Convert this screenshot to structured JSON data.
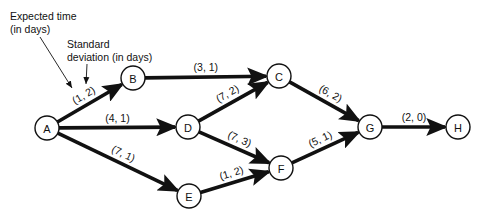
{
  "annotations": {
    "expected_time": {
      "line1": "Expected time",
      "line2": "(in days)"
    },
    "std_dev": {
      "line1": "Standard",
      "line2": "deviation (in days)"
    }
  },
  "nodes": [
    {
      "id": "A",
      "label": "A",
      "x": 47,
      "y": 128
    },
    {
      "id": "B",
      "label": "B",
      "x": 133,
      "y": 78
    },
    {
      "id": "C",
      "label": "C",
      "x": 279,
      "y": 76
    },
    {
      "id": "D",
      "label": "D",
      "x": 188,
      "y": 127
    },
    {
      "id": "E",
      "label": "E",
      "x": 189,
      "y": 196
    },
    {
      "id": "F",
      "label": "F",
      "x": 281,
      "y": 168
    },
    {
      "id": "G",
      "label": "G",
      "x": 370,
      "y": 127
    },
    {
      "id": "H",
      "label": "H",
      "x": 458,
      "y": 127
    }
  ],
  "edges": [
    {
      "from": "A",
      "to": "B",
      "label": "(1, 2)",
      "expected_time": 1,
      "std_dev": 2
    },
    {
      "from": "A",
      "to": "D",
      "label": "(4, 1)",
      "expected_time": 4,
      "std_dev": 1
    },
    {
      "from": "A",
      "to": "E",
      "label": "(7, 1)",
      "expected_time": 7,
      "std_dev": 1
    },
    {
      "from": "B",
      "to": "C",
      "label": "(3, 1)",
      "expected_time": 3,
      "std_dev": 1
    },
    {
      "from": "D",
      "to": "C",
      "label": "(7, 2)",
      "expected_time": 7,
      "std_dev": 2
    },
    {
      "from": "D",
      "to": "F",
      "label": "(7, 3)",
      "expected_time": 7,
      "std_dev": 3
    },
    {
      "from": "E",
      "to": "F",
      "label": "(1, 2)",
      "expected_time": 1,
      "std_dev": 2
    },
    {
      "from": "C",
      "to": "G",
      "label": "(6, 2)",
      "expected_time": 6,
      "std_dev": 2
    },
    {
      "from": "F",
      "to": "G",
      "label": "(5, 1)",
      "expected_time": 5,
      "std_dev": 1
    },
    {
      "from": "G",
      "to": "H",
      "label": "(2, 0)",
      "expected_time": 2,
      "std_dev": 0
    }
  ]
}
